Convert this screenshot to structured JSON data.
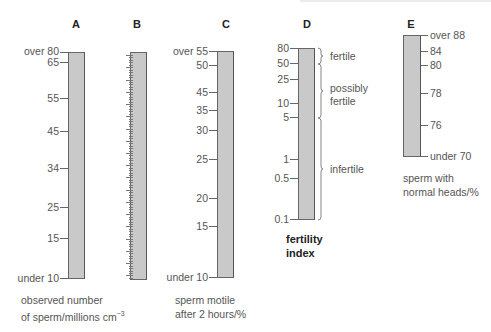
{
  "chart_data": {
    "type": "nomogram",
    "title": "",
    "scales": [
      {
        "id": "A",
        "caption": [
          "observed number",
          "of sperm/millions cm⁻³"
        ],
        "ticks": [
          {
            "label": "over 80",
            "y": 52
          },
          {
            "label": "65",
            "y": 62
          },
          {
            "label": "55",
            "y": 98
          },
          {
            "label": "45",
            "y": 131
          },
          {
            "label": "34",
            "y": 168
          },
          {
            "label": "25",
            "y": 207
          },
          {
            "label": "15",
            "y": 238
          },
          {
            "label": "under 10",
            "y": 278
          }
        ]
      },
      {
        "id": "B",
        "caption": [],
        "ticks": []
      },
      {
        "id": "C",
        "caption": [
          "sperm motile",
          "after 2 hours/%"
        ],
        "ticks": [
          {
            "label": "over 55",
            "y": 51
          },
          {
            "label": "50",
            "y": 65
          },
          {
            "label": "45",
            "y": 92
          },
          {
            "label": "35",
            "y": 110
          },
          {
            "label": "30",
            "y": 130
          },
          {
            "label": "25",
            "y": 159
          },
          {
            "label": "20",
            "y": 198
          },
          {
            "label": "15",
            "y": 226
          },
          {
            "label": "under 10",
            "y": 277
          }
        ]
      },
      {
        "id": "D",
        "caption": [
          "fertility",
          "index"
        ],
        "ticks": [
          {
            "label": "80",
            "y": 48
          },
          {
            "label": "50",
            "y": 63
          },
          {
            "label": "25",
            "y": 79
          },
          {
            "label": "10",
            "y": 103
          },
          {
            "label": "5",
            "y": 117
          },
          {
            "label": "1",
            "y": 159
          },
          {
            "label": "0.5",
            "y": 178
          },
          {
            "label": "0.1",
            "y": 219
          }
        ],
        "ranges": [
          {
            "label": [
              "fertile"
            ],
            "from": "80",
            "to": "50"
          },
          {
            "label": [
              "possibly",
              "fertile"
            ],
            "from": "50",
            "to": "5"
          },
          {
            "label": [
              "infertile"
            ],
            "from": "5",
            "to": "0.1"
          }
        ]
      },
      {
        "id": "E",
        "caption": [
          "sperm with",
          "normal heads/%"
        ],
        "ticks": [
          {
            "label": "over 88",
            "y": 35
          },
          {
            "label": "84",
            "y": 51
          },
          {
            "label": "80",
            "y": 65
          },
          {
            "label": "78",
            "y": 93
          },
          {
            "label": "76",
            "y": 125
          },
          {
            "label": "under 70",
            "y": 156
          }
        ]
      }
    ]
  },
  "letters": {
    "a": "A",
    "b": "B",
    "c": "C",
    "d": "D",
    "e": "E"
  },
  "a": {
    "ticks": [
      "over 80",
      "65",
      "55",
      "45",
      "34",
      "25",
      "15",
      "under 10"
    ],
    "caption1": "observed number",
    "caption2": "of sperm/millions cm",
    "caption_sup": "−3"
  },
  "c": {
    "ticks": [
      "over 55",
      "50",
      "45",
      "35",
      "30",
      "25",
      "20",
      "15",
      "under 10"
    ],
    "caption1": "sperm motile",
    "caption2": "after 2 hours/%"
  },
  "d": {
    "ticks": [
      "80",
      "50",
      "25",
      "10",
      "5",
      "1",
      "0.5",
      "0.1"
    ],
    "range_fertile": "fertile",
    "range_possibly1": "possibly",
    "range_possibly2": "fertile",
    "range_infertile": "infertile",
    "caption1": "fertility",
    "caption2": "index"
  },
  "e": {
    "ticks": [
      "over 88",
      "84",
      "80",
      "78",
      "76",
      "under 70"
    ],
    "caption1": "sperm with",
    "caption2": "normal heads/%"
  }
}
